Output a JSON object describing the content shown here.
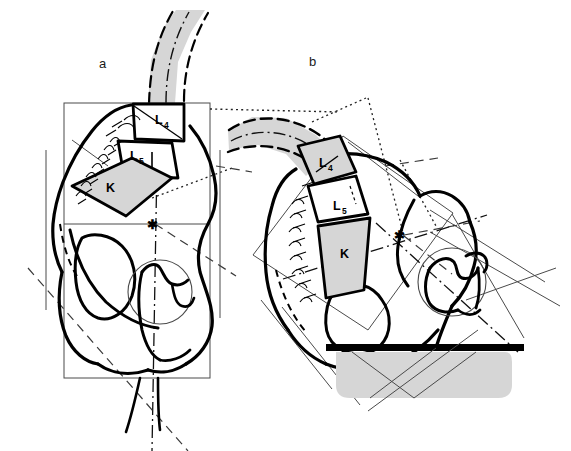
{
  "figure": {
    "background_color": "#ffffff",
    "ink_color": "#000000",
    "shade_color": "#d6d6d6",
    "construction_color": "#3a3a3a"
  },
  "panels": [
    {
      "id": "a",
      "label": "a",
      "label_x": 99,
      "label_y": 68,
      "description": "Upright neutral pelvis with vertical reference frame",
      "frame": "rectangular-box",
      "support": "none",
      "bones": [
        {
          "name": "L4",
          "label": "L",
          "subscript": "4",
          "label_x": 159,
          "label_y": 117,
          "shaded": false
        },
        {
          "name": "L5",
          "label": "L",
          "subscript": "5",
          "label_x": 134,
          "label_y": 154,
          "shaded": false
        },
        {
          "name": "K",
          "label": "K",
          "subscript": "",
          "label_x": 106,
          "label_y": 187,
          "shaded": true
        }
      ],
      "markers": [
        {
          "name": "centre-of-rotation-asterisk",
          "glyph": "✱",
          "x": 152,
          "y": 224
        }
      ]
    },
    {
      "id": "b",
      "label": "b",
      "label_x": 309,
      "label_y": 66,
      "description": "Reclined / tilted pelvis resting on a horizontal support surface",
      "frame": "rotated-box",
      "support": "horizontal-bar-with-shaded-cushion",
      "bones": [
        {
          "name": "L4",
          "label": "L",
          "subscript": "4",
          "label_x": 323,
          "label_y": 162,
          "shaded": true
        },
        {
          "name": "L5",
          "label": "L",
          "subscript": "5",
          "label_x": 337,
          "label_y": 205,
          "shaded": false
        },
        {
          "name": "K",
          "label": "K",
          "subscript": "",
          "label_x": 344,
          "label_y": 253,
          "shaded": true
        }
      ],
      "markers": [
        {
          "name": "centre-of-rotation-asterisk",
          "glyph": "✱",
          "x": 399,
          "y": 235
        }
      ]
    }
  ],
  "line_styles": {
    "outline": "solid thick black contour",
    "construction": "thin solid grey",
    "axis": "dash-dot centreline",
    "projection": "dotted",
    "alignment": "long dashed"
  },
  "legend_note": ""
}
